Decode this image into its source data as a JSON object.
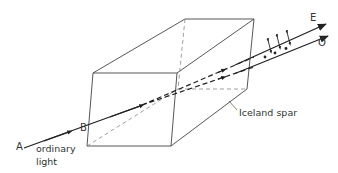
{
  "diagram": {
    "labels": {
      "point_a": "A",
      "point_b": "B",
      "incident": "ordinary",
      "incident_line2": "light",
      "crystal": "Iceland spar",
      "extraordinary": "E",
      "ordinary": "O"
    },
    "colors": {
      "line": "#222222",
      "edge": "#444444",
      "hidden_edge": "#777777",
      "text": "#333333",
      "background": "#ffffff"
    }
  }
}
